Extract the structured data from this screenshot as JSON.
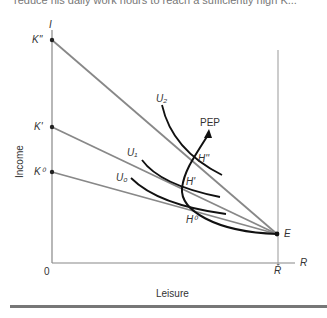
{
  "header_fragment": "reduce his daily work hours to reach a sufficiently high K...",
  "axes": {
    "y_axis_symbol": "I",
    "x_axis_symbol": "R",
    "y_label": "Income",
    "x_label": "Leisure",
    "origin": "0",
    "r_bar": "R̄"
  },
  "intercepts": {
    "k_double_prime": "K''",
    "k_prime": "K'",
    "k_zero": "K⁰"
  },
  "curves": {
    "u2": "U₂",
    "u1": "U₁",
    "u0": "U₀",
    "pep": "PEP"
  },
  "points": {
    "h_double_prime": "H''",
    "h_prime": "H'",
    "h_zero": "H⁰",
    "e": "E"
  },
  "colors": {
    "axis": "#777777",
    "budget_line": "#888888",
    "curve": "#111111"
  }
}
